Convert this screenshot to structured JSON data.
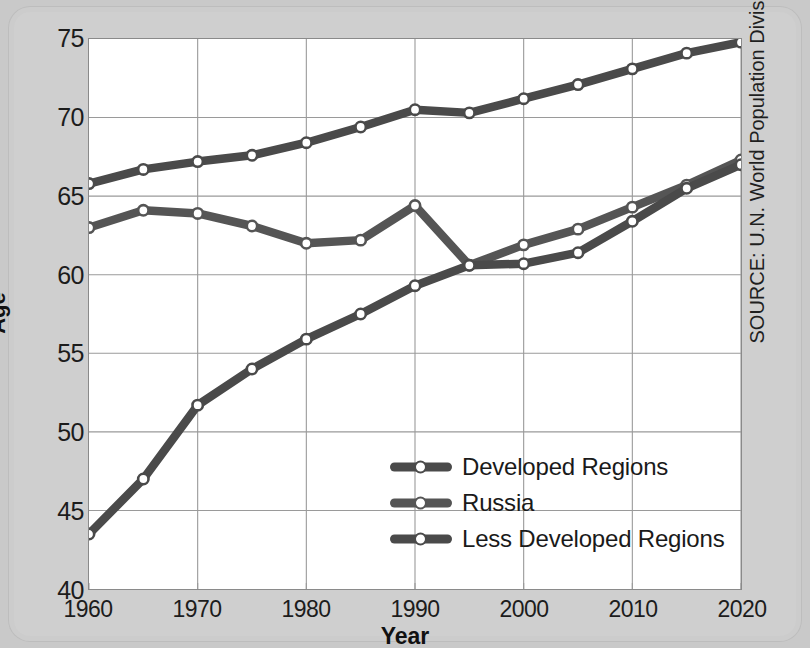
{
  "chart_data": {
    "type": "line",
    "title": "",
    "xlabel": "Year",
    "ylabel": "Age",
    "xlim": [
      1960,
      2020
    ],
    "ylim": [
      40,
      75
    ],
    "ytick_step": 5,
    "xtick_step": 10,
    "grid": true,
    "legend_position": "center-right-inside",
    "x": [
      1960,
      1965,
      1970,
      1975,
      1980,
      1985,
      1990,
      1995,
      2000,
      2005,
      2010,
      2015,
      2020
    ],
    "xtick_labels": [
      "1960",
      "1970",
      "1980",
      "1990",
      "2000",
      "2010",
      "2020"
    ],
    "ytick_labels": [
      "40",
      "45",
      "50",
      "55",
      "60",
      "65",
      "70",
      "75"
    ],
    "series": [
      {
        "name": "Developed Regions",
        "color": "#4a4a4a",
        "values": [
          65.8,
          66.7,
          67.2,
          67.6,
          68.4,
          69.4,
          70.5,
          70.3,
          71.2,
          72.1,
          73.1,
          74.1,
          74.8
        ]
      },
      {
        "name": "Russia",
        "color": "#555555",
        "values": [
          63.0,
          64.1,
          63.9,
          63.1,
          62.0,
          62.2,
          64.4,
          60.6,
          61.9,
          62.9,
          64.3,
          65.7,
          67.3
        ]
      },
      {
        "name": "Less Developed Regions",
        "color": "#4a4a4a",
        "values": [
          43.5,
          47.0,
          51.7,
          54.0,
          55.9,
          57.5,
          59.3,
          60.6,
          60.7,
          61.4,
          63.4,
          65.5,
          67.0
        ]
      }
    ],
    "annotations": {
      "source": "SOURCE: U.N. World Population Division"
    }
  },
  "axes": {
    "ylabel": "Age",
    "xlabel": "Year"
  },
  "source_note": "SOURCE: U.N. World Population Division",
  "legend": {
    "items": [
      {
        "label": "Developed Regions"
      },
      {
        "label": "Russia"
      },
      {
        "label": "Less Developed Regions"
      }
    ]
  },
  "colors": {
    "line": "#4a4a4a",
    "marker_fill": "#ffffff",
    "plot_background": "#ffffff",
    "card_background": "#cccccc",
    "grid": "#9a9a9a",
    "text": "#1c1c1c"
  }
}
